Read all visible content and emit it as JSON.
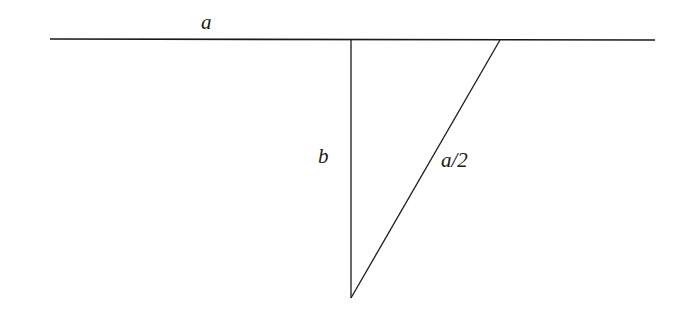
{
  "diagram": {
    "labels": {
      "top_line": "a",
      "vertical_side": "b",
      "hypotenuse": "a/2"
    },
    "colors": {
      "stroke": "#1a1a1a",
      "background": "#ffffff"
    }
  }
}
